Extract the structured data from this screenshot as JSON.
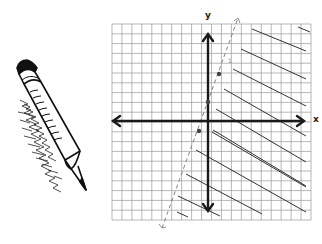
{
  "figure": {
    "type": "linear inequality graph",
    "axis_labels": {
      "x": "x",
      "y": "y"
    },
    "grid": {
      "cells_x": 20,
      "cells_y": 20,
      "color": "#9a9a9a"
    },
    "axes_color": "#1a1a1a",
    "boundary_line": {
      "style": "dashed",
      "points_marked": [
        [
          -1,
          -1
        ],
        [
          0,
          1
        ],
        [
          1,
          3
        ]
      ],
      "equation": "y = 2x + 1"
    },
    "shaded_region": "right of / below the line",
    "tick_mark_label": "1"
  },
  "illustration": {
    "name": "pencil",
    "description": "hand-drawn pencil with scribbled shading"
  }
}
